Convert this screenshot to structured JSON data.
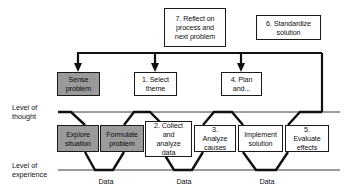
{
  "diagram": {
    "colors": {
      "line_dark": "#1a1a1a",
      "line_gray": "#999999",
      "box_fill_gray": "#9a9a9a",
      "box_fill_white": "#ffffff",
      "text": "#111111",
      "background": "#ffffff"
    },
    "axis_labels": [
      {
        "id": "level-of-thought",
        "line1": "Level of",
        "line2": "thought"
      },
      {
        "id": "level-of-experience",
        "line1": "Level of",
        "line2": "experience"
      }
    ],
    "top_boxes": [
      {
        "id": "reflect-on-process",
        "lines": [
          "7. Reflect on",
          "process and",
          "next problem"
        ],
        "fill": "white"
      },
      {
        "id": "standardize-solution",
        "lines": [
          "6. Standardize",
          "solution"
        ],
        "fill": "white"
      }
    ],
    "thought_boxes": [
      {
        "id": "sense-problem",
        "lines": [
          "Sense",
          "problem"
        ],
        "fill": "gray"
      },
      {
        "id": "select-theme",
        "lines": [
          "1. Select",
          "theme"
        ],
        "fill": "white"
      },
      {
        "id": "plan-and",
        "lines": [
          "4. Plan",
          "and..."
        ],
        "fill": "white"
      }
    ],
    "experience_boxes": [
      {
        "id": "explore-situation",
        "lines": [
          "Explore",
          "situation"
        ],
        "fill": "gray"
      },
      {
        "id": "formulate-problem",
        "lines": [
          "Formulate",
          "problem"
        ],
        "fill": "gray"
      },
      {
        "id": "collect-and-analyze-data",
        "lines": [
          "2. Collect",
          "and analyze",
          "data"
        ],
        "fill": "white"
      },
      {
        "id": "analyze-causes",
        "lines": [
          "3. Analyze",
          "causes"
        ],
        "fill": "white"
      },
      {
        "id": "implement-solution",
        "lines": [
          "Implement",
          "solution"
        ],
        "fill": "white"
      },
      {
        "id": "evaluate-effects",
        "lines": [
          "5. Evaluate",
          "effects"
        ],
        "fill": "white"
      }
    ],
    "data_labels": [
      {
        "id": "data-1",
        "text": "Data"
      },
      {
        "id": "data-2",
        "text": "Data"
      },
      {
        "id": "data-3",
        "text": "Data"
      }
    ]
  }
}
